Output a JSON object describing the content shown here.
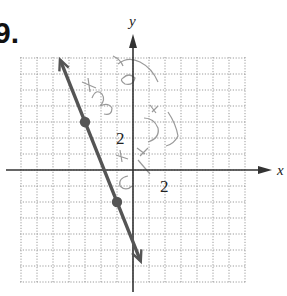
{
  "problem": {
    "number_label": "9."
  },
  "chart_data": {
    "type": "line",
    "title": "",
    "xlabel": "x",
    "ylabel": "y",
    "tick_labels": {
      "x": [
        "2"
      ],
      "y": [
        "2"
      ]
    },
    "xlim": [
      -7,
      7
    ],
    "ylim": [
      -7,
      7
    ],
    "grid": true,
    "grid_style": "dotted",
    "series": [
      {
        "name": "line",
        "equation": "y = -5/2 x - 9/2",
        "points": [
          {
            "x": -3,
            "y": 3
          },
          {
            "x": -1,
            "y": -2
          }
        ],
        "arrows_both_ends": true,
        "color": "#555555"
      }
    ],
    "annotations": [
      "handwritten pencil marks (illegible) near y-axis"
    ]
  },
  "colors": {
    "grid": "#9a9a9a",
    "axis": "#333333",
    "line": "#555555",
    "pencil": "#9a9a9a"
  }
}
